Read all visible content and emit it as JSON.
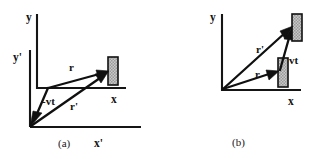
{
  "figure": {
    "background_color": "#ffffff",
    "ink_color": "#121212",
    "object_fill_color": "#b9b9b9",
    "panels": [
      {
        "id": "a",
        "caption": "(a)",
        "axes": [
          {
            "name": "y-axis-unprimed",
            "label": "y"
          },
          {
            "name": "x-axis-unprimed",
            "label": "x"
          },
          {
            "name": "y-axis-primed",
            "label": "y'"
          },
          {
            "name": "x-axis-primed",
            "label": "x'"
          }
        ],
        "vectors": [
          {
            "name": "vector-r",
            "label": "r"
          },
          {
            "name": "vector-r-prime",
            "label": "r'"
          },
          {
            "name": "vector-minus-vt",
            "label": "-vt"
          }
        ],
        "objects": [
          {
            "name": "particle-box",
            "label": ""
          }
        ]
      },
      {
        "id": "b",
        "caption": "(b)",
        "axes": [
          {
            "name": "y-axis",
            "label": "y"
          },
          {
            "name": "x-axis",
            "label": "x"
          }
        ],
        "vectors": [
          {
            "name": "vector-r",
            "label": "r"
          },
          {
            "name": "vector-r-prime",
            "label": "r'"
          },
          {
            "name": "vector-vt",
            "label": "vt"
          }
        ],
        "objects": [
          {
            "name": "particle-box-initial",
            "label": ""
          },
          {
            "name": "particle-box-displaced",
            "label": ""
          }
        ]
      }
    ]
  }
}
